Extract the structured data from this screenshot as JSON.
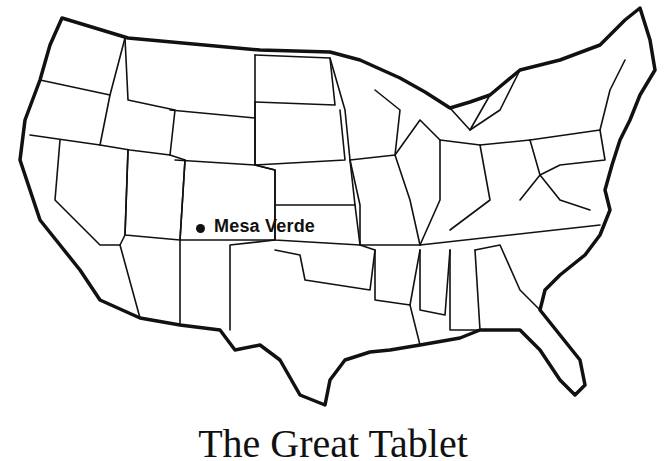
{
  "map": {
    "type": "outline map",
    "region": "Contiguous United States",
    "style": "black state borders on white"
  },
  "marker": {
    "label": "Mesa Verde",
    "icon": "dot-marker"
  },
  "caption": {
    "text": "The Great Tablet",
    "note": "partially cut off at bottom edge"
  }
}
